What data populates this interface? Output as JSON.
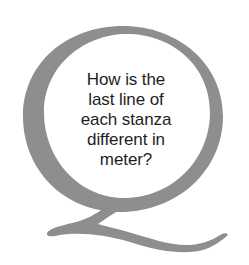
{
  "callout": {
    "letter": "Q",
    "ring_color": "#8e8e8e",
    "background_color": "#ffffff",
    "text_color": "#1e1e1e",
    "question_lines": [
      "How is the",
      "last line of",
      "each stanza",
      "different in",
      "meter?"
    ],
    "question": "How is the last line of each stanza different in meter?"
  }
}
